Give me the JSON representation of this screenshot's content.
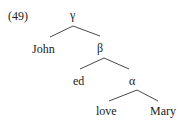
{
  "example_number": "(49)",
  "tree": {
    "root": {
      "label": "γ"
    },
    "nodes": [
      {
        "id": "john",
        "label": "John",
        "parent": "γ"
      },
      {
        "id": "beta",
        "label": "β",
        "parent": "γ"
      },
      {
        "id": "ed",
        "label": "ed",
        "parent": "β"
      },
      {
        "id": "alpha",
        "label": "α",
        "parent": "β"
      },
      {
        "id": "love",
        "label": "love",
        "parent": "α"
      },
      {
        "id": "mary",
        "label": "Mary",
        "parent": "α"
      }
    ]
  }
}
